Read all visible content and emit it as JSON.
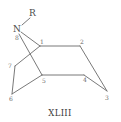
{
  "figure": {
    "title": "XLIII",
    "heteroatom": {
      "symbol": "N",
      "substituent": "R",
      "position": "8"
    },
    "ring_positions": [
      "1",
      "2",
      "3",
      "4",
      "5",
      "6",
      "7",
      "8"
    ],
    "atoms": [
      {
        "id": "N",
        "label": "N",
        "x": 18,
        "y": 30
      },
      {
        "id": "R",
        "label": "R",
        "x": 33,
        "y": 15
      },
      {
        "id": "C1",
        "label": "1",
        "x": 40,
        "y": 46
      },
      {
        "id": "C2",
        "label": "2",
        "x": 80,
        "y": 46
      },
      {
        "id": "C3",
        "label": "3",
        "x": 107,
        "y": 91
      },
      {
        "id": "C4",
        "label": "4",
        "x": 84,
        "y": 75
      },
      {
        "id": "C5",
        "label": "5",
        "x": 42,
        "y": 75
      },
      {
        "id": "C6",
        "label": "6",
        "x": 12,
        "y": 94
      },
      {
        "id": "C7",
        "label": "7",
        "x": 15,
        "y": 66
      }
    ],
    "bonds": [
      [
        "R",
        "N"
      ],
      [
        "N",
        "C1"
      ],
      [
        "N",
        "C5"
      ],
      [
        "C1",
        "C2"
      ],
      [
        "C2",
        "C3"
      ],
      [
        "C3",
        "C4"
      ],
      [
        "C4",
        "C5"
      ],
      [
        "C5",
        "C6"
      ],
      [
        "C6",
        "C7"
      ],
      [
        "C7",
        "C1"
      ]
    ]
  }
}
